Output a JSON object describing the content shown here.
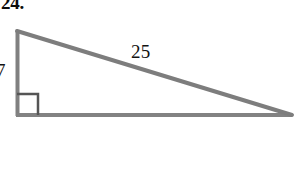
{
  "figure": {
    "problem_number": "24.",
    "shape_name": "right-triangle",
    "background_color": "#ffffff",
    "stroke_color": "#808080",
    "stroke_width": 4,
    "text_color": "#121212",
    "canvas": {
      "width": 303,
      "height": 191
    },
    "vertices": {
      "top_left": {
        "x": 16,
        "y": 30
      },
      "bottom_left": {
        "x": 16,
        "y": 116
      },
      "right": {
        "x": 292,
        "y": 116
      }
    },
    "right_angle_marker": {
      "name": "right-angle-square",
      "x": 17,
      "y": 94,
      "size": 21
    },
    "labels": [
      {
        "id": "hypotenuse",
        "text": "25",
        "side": "hypotenuse",
        "x": 145,
        "y": 52
      },
      {
        "id": "leg-vertical",
        "text": "7",
        "side": "vertical-leg",
        "x": 4,
        "y": 71,
        "clipped": true
      }
    ]
  }
}
